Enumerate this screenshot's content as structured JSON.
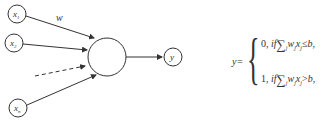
{
  "diagram": {
    "type": "perceptron / artificial neuron",
    "inputs": [
      {
        "label": "x",
        "subscript": "1"
      },
      {
        "label": "x",
        "subscript": "2"
      },
      {
        "label": "x",
        "subscript": "n"
      }
    ],
    "weight_label": "w",
    "output_label": "y",
    "colors": {
      "stroke": "#333333",
      "background": "#ffffff"
    }
  },
  "formula": {
    "lhs": "y=",
    "cases": [
      {
        "value": "0,",
        "cond_if": "if",
        "sum": "∑",
        "sum_index": "j",
        "w": "w",
        "w_sub": "j",
        "x": "x",
        "x_sub": "j",
        "rel": "≤",
        "b": "b,"
      },
      {
        "value": "1,",
        "cond_if": "if",
        "sum": "∑",
        "sum_index": "j",
        "w": "w",
        "w_sub": "j",
        "x": "x",
        "x_sub": "j",
        "rel": ">",
        "b": "b,"
      }
    ]
  }
}
